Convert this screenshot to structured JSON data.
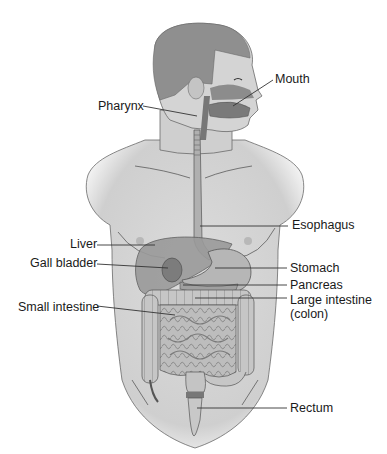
{
  "diagram": {
    "colors": {
      "skin": "#d2d2d2",
      "skin_shade": "#b9b9b9",
      "hair": "#8f8f8f",
      "organ": "#a4a4a4",
      "organ_dark": "#7c7c7c",
      "intestine": "#bdbdbd",
      "line": "#333333",
      "text": "#1a1a1a"
    },
    "labels": [
      {
        "id": "mouth",
        "text": "Mouth",
        "x": 275,
        "y": 72,
        "line": [
          273,
          80,
          233,
          106
        ]
      },
      {
        "id": "pharynx",
        "text": "Pharynx",
        "x": 98,
        "y": 99,
        "line": [
          143,
          106,
          197,
          116
        ]
      },
      {
        "id": "esophagus",
        "text": "Esophagus",
        "x": 292,
        "y": 218,
        "line": [
          200,
          226,
          288,
          226
        ]
      },
      {
        "id": "liver",
        "text": "Liver",
        "x": 70,
        "y": 237,
        "line": [
          97,
          245,
          155,
          245
        ]
      },
      {
        "id": "gall-bladder",
        "text": "Gall bladder",
        "x": 30,
        "y": 256,
        "line": [
          97,
          264,
          168,
          268
        ]
      },
      {
        "id": "stomach",
        "text": "Stomach",
        "x": 290,
        "y": 261,
        "line": [
          215,
          268,
          287,
          268
        ]
      },
      {
        "id": "pancreas",
        "text": "Pancreas",
        "x": 290,
        "y": 278,
        "line": [
          183,
          285,
          287,
          285
        ]
      },
      {
        "id": "large-intestine",
        "text": "Large intestine",
        "subtext": "(colon)",
        "x": 290,
        "y": 293,
        "line": [
          195,
          298,
          287,
          298
        ]
      },
      {
        "id": "small-intestine",
        "text": "Small intestine",
        "x": 18,
        "y": 300,
        "line": [
          97,
          306,
          175,
          315
        ]
      },
      {
        "id": "rectum",
        "text": "Rectum",
        "x": 290,
        "y": 401,
        "line": [
          197,
          408,
          287,
          408
        ]
      }
    ]
  }
}
